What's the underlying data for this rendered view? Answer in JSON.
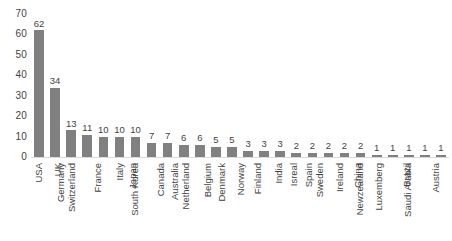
{
  "chart_data": {
    "type": "bar",
    "title": "",
    "subtitle": "",
    "xlabel": "",
    "ylabel": "",
    "ylim": [
      0,
      70
    ],
    "yticks": [
      0,
      10,
      20,
      30,
      40,
      50,
      60,
      70
    ],
    "grid": false,
    "legend": false,
    "legend_position": "none",
    "orientation": "vertical",
    "bar_color": "#808080",
    "label_color": "#3f3f3f",
    "axis_line_color": "#d9d9d9",
    "show_data_labels": true,
    "categories": [
      "USA",
      "UK",
      "Germany",
      "Switzerland",
      "France",
      "Italy",
      "Japan",
      "South Korea",
      "Canada",
      "Australia",
      "Netherland",
      "Belgium",
      "Denmark",
      "Norway",
      "Finland",
      "India",
      "Isreal",
      "Spain",
      "Sweden",
      "Ireland",
      "China",
      "Newzealand",
      "Luxemberg",
      "Brazil",
      "Saudi Arabia",
      "Austria"
    ],
    "values": [
      62,
      34,
      13,
      11,
      10,
      10,
      10,
      7,
      7,
      6,
      6,
      5,
      5,
      3,
      3,
      3,
      2,
      2,
      2,
      2,
      2,
      1,
      1,
      1,
      1,
      1
    ],
    "data_labels": [
      "62",
      "34",
      "13",
      "11",
      "10",
      "10",
      "10",
      "7",
      "7",
      "6",
      "6",
      "5",
      "5",
      "3",
      "3",
      "3",
      "2",
      "2",
      "2",
      "2",
      "2",
      "1",
      "1",
      "1",
      "1",
      "1"
    ],
    "ytick_labels": [
      "0",
      "10",
      "20",
      "30",
      "40",
      "50",
      "60",
      "70"
    ]
  }
}
